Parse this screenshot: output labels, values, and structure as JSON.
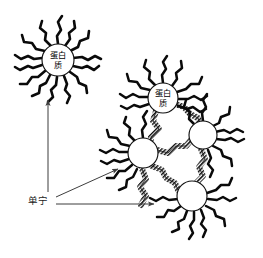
{
  "figure": {
    "background_color": "#ffffff",
    "ink_color": "#0a0a0a",
    "arrow_color": "#3d3d3d",
    "width": 263,
    "height": 258
  },
  "labels": {
    "protein_line1": "蛋白",
    "protein_line2": "质",
    "protein_full": "蛋白质",
    "tannin": "单宁"
  },
  "molecules": {
    "free_protein": {
      "name": "free-protein-molecule",
      "label_line1": "蛋白",
      "label_line2": "质",
      "center_x": 58,
      "center_y": 60,
      "radius": 16,
      "tail_count": 14
    },
    "aggregate_proteins": [
      {
        "name": "aggregate-protein-top",
        "label_line1": "蛋白",
        "label_line2": "质",
        "center_x": 163,
        "center_y": 98,
        "radius": 15,
        "tail_count": 11,
        "labeled": true
      },
      {
        "name": "aggregate-protein-left",
        "center_x": 143,
        "center_y": 153,
        "radius": 15,
        "tail_count": 10,
        "labeled": false
      },
      {
        "name": "aggregate-protein-right",
        "center_x": 203,
        "center_y": 135,
        "radius": 14,
        "tail_count": 10,
        "labeled": false
      },
      {
        "name": "aggregate-protein-bottom",
        "center_x": 192,
        "center_y": 196,
        "radius": 15,
        "tail_count": 11,
        "labeled": false
      }
    ],
    "bridges": [
      {
        "name": "bridge-top-to-left",
        "from": "aggregate-protein-top",
        "to": "aggregate-protein-left"
      },
      {
        "name": "bridge-top-to-right",
        "from": "aggregate-protein-top",
        "to": "aggregate-protein-right"
      },
      {
        "name": "bridge-left-to-right",
        "from": "aggregate-protein-left",
        "to": "aggregate-protein-right"
      },
      {
        "name": "bridge-left-to-bottom",
        "from": "aggregate-protein-left",
        "to": "aggregate-protein-bottom"
      },
      {
        "name": "bridge-right-to-bottom",
        "from": "aggregate-protein-right",
        "to": "aggregate-protein-bottom"
      }
    ]
  },
  "annotations": {
    "tannin_label_x": 30,
    "tannin_label_y": 201,
    "arrows": [
      {
        "name": "arrow-tannin-to-free-protein",
        "x1": 48,
        "y1": 192,
        "x2": 48,
        "y2": 100
      },
      {
        "name": "arrow-tannin-to-aggregate-tail",
        "x1": 56,
        "y1": 197,
        "x2": 118,
        "y2": 169
      },
      {
        "name": "arrow-tannin-to-aggregate-bridge",
        "x1": 56,
        "y1": 204,
        "x2": 156,
        "y2": 204
      }
    ]
  }
}
